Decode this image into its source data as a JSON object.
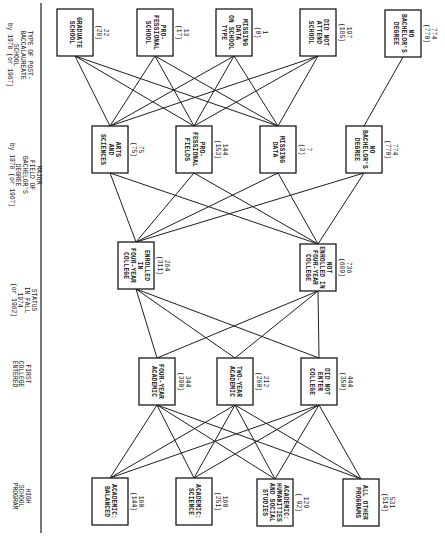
{
  "orientation": "rotated 90 degrees clockwise",
  "levels": [
    {
      "id": "hs_program",
      "label_lines": [
        "HIGH",
        "SCHOOL",
        "PROGRAM"
      ],
      "nodes": [
        {
          "id": "hs_balanced",
          "label_lines": [
            "ACADEMIC:",
            "BALANCED"
          ],
          "count": "180",
          "alt_count": "(144)"
        },
        {
          "id": "hs_science",
          "label_lines": [
            "ACADEMIC:",
            "SCIENCE"
          ],
          "count": "160",
          "alt_count": "(251)"
        },
        {
          "id": "hs_humanities",
          "label_lines": [
            "ACADEMIC:",
            "HUMANITIES",
            "AND SOCIAL",
            "STUDIES"
          ],
          "count": "129",
          "alt_count": "( 92)"
        },
        {
          "id": "hs_other",
          "label_lines": [
            "ALL OTHER",
            "PROGRAMS"
          ],
          "count": "531",
          "alt_count": "(514)"
        }
      ]
    },
    {
      "id": "first_college",
      "label_lines": [
        "FIRST",
        "COLLEGE",
        "ENTERED"
      ],
      "nodes": [
        {
          "id": "fc_four",
          "label_lines": [
            "FOUR-YEAR",
            "ACADEMIC"
          ],
          "count": "344",
          "alt_count": "(390)"
        },
        {
          "id": "fc_two",
          "label_lines": [
            "TWO-YEAR",
            "ACADEMIC"
          ],
          "count": "212",
          "alt_count": "(260)"
        },
        {
          "id": "fc_none",
          "label_lines": [
            "DID NOT",
            "ENTER",
            "COLLEGE"
          ],
          "count": "444",
          "alt_count": "(350)"
        }
      ]
    },
    {
      "id": "status_1974",
      "label_lines": [
        "STATUS",
        "IN FALL",
        "1974",
        "(or 1962)"
      ],
      "nodes": [
        {
          "id": "st_enrolled",
          "label_lines": [
            "ENROLLED",
            "IN",
            "FOUR-YEAR",
            "COLLEGE"
          ],
          "count": "264",
          "alt_count": "(311)"
        },
        {
          "id": "st_not",
          "label_lines": [
            "NOT",
            "ENROLLED IN",
            "FOUR-YEAR",
            "COLLEGE"
          ],
          "count": "736",
          "alt_count": "(689)"
        }
      ]
    },
    {
      "id": "major_field",
      "label_lines": [
        "MAJOR",
        "FIELD OF",
        "BACHELOR'S",
        "DEGREE",
        "by 1978 (or 1967)"
      ],
      "nodes": [
        {
          "id": "mf_arts",
          "label_lines": [
            "ARTS",
            "AND",
            "SCIENCES"
          ],
          "count": "75",
          "alt_count": "(75)"
        },
        {
          "id": "mf_prof",
          "label_lines": [
            "PRO-",
            "FESSIONAL",
            "FIELDS"
          ],
          "count": "144",
          "alt_count": "(153)"
        },
        {
          "id": "mf_missing",
          "label_lines": [
            "MISSING",
            "DATA"
          ],
          "count": "7",
          "alt_count": "(3)"
        },
        {
          "id": "mf_nobach",
          "label_lines": [
            "NO",
            "BACHELOR'S",
            "DEGREE"
          ],
          "count": "774",
          "alt_count": "(770)"
        }
      ]
    },
    {
      "id": "post_bacc",
      "label_lines": [
        "TYPE OF POST-",
        "BACCALAUREATE",
        "SCHOOL",
        "by 1978 (or 1967)"
      ],
      "nodes": [
        {
          "id": "pb_grad",
          "label_lines": [
            "GRADUATE",
            "SCHOOL"
          ],
          "count": "22",
          "alt_count": "(28)"
        },
        {
          "id": "pb_prof",
          "label_lines": [
            "PRO-",
            "FESSIONAL",
            "SCHOOL"
          ],
          "count": "13",
          "alt_count": "(17)"
        },
        {
          "id": "pb_missing",
          "label_lines": [
            "MISSING",
            "DATA",
            "ON SCHOOL",
            "TYPE"
          ],
          "count": "1",
          "alt_count": "(0)"
        },
        {
          "id": "pb_none",
          "label_lines": [
            "DID NOT",
            "ATTEND",
            "SCHOOL"
          ],
          "count": "197",
          "alt_count": "(185)"
        },
        {
          "id": "pb_nobach",
          "label_lines": [
            "NO",
            "BACHELOR'S",
            "DEGREE"
          ],
          "count": "774",
          "alt_count": "(770)"
        }
      ]
    }
  ],
  "edges": [
    [
      "hs_balanced",
      "fc_four"
    ],
    [
      "hs_balanced",
      "fc_two"
    ],
    [
      "hs_balanced",
      "fc_none"
    ],
    [
      "hs_science",
      "fc_four"
    ],
    [
      "hs_science",
      "fc_two"
    ],
    [
      "hs_science",
      "fc_none"
    ],
    [
      "hs_humanities",
      "fc_four"
    ],
    [
      "hs_humanities",
      "fc_two"
    ],
    [
      "hs_humanities",
      "fc_none"
    ],
    [
      "hs_other",
      "fc_four"
    ],
    [
      "hs_other",
      "fc_two"
    ],
    [
      "hs_other",
      "fc_none"
    ],
    [
      "fc_four",
      "st_enrolled"
    ],
    [
      "fc_four",
      "st_not"
    ],
    [
      "fc_two",
      "st_enrolled"
    ],
    [
      "fc_two",
      "st_not"
    ],
    [
      "fc_none",
      "st_enrolled"
    ],
    [
      "fc_none",
      "st_not"
    ],
    [
      "st_enrolled",
      "mf_arts"
    ],
    [
      "st_enrolled",
      "mf_prof"
    ],
    [
      "st_enrolled",
      "mf_missing"
    ],
    [
      "st_enrolled",
      "mf_nobach"
    ],
    [
      "st_not",
      "mf_arts"
    ],
    [
      "st_not",
      "mf_prof"
    ],
    [
      "st_not",
      "mf_missing"
    ],
    [
      "st_not",
      "mf_nobach"
    ],
    [
      "mf_arts",
      "pb_grad"
    ],
    [
      "mf_arts",
      "pb_prof"
    ],
    [
      "mf_arts",
      "pb_missing"
    ],
    [
      "mf_arts",
      "pb_none"
    ],
    [
      "mf_prof",
      "pb_grad"
    ],
    [
      "mf_prof",
      "pb_prof"
    ],
    [
      "mf_prof",
      "pb_missing"
    ],
    [
      "mf_prof",
      "pb_none"
    ],
    [
      "mf_missing",
      "pb_grad"
    ],
    [
      "mf_missing",
      "pb_prof"
    ],
    [
      "mf_missing",
      "pb_missing"
    ],
    [
      "mf_missing",
      "pb_none"
    ],
    [
      "mf_nobach",
      "pb_nobach"
    ]
  ]
}
